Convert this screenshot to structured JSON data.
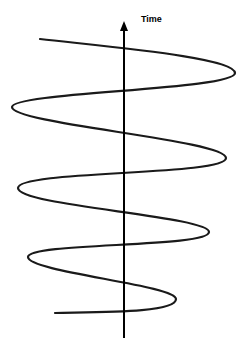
{
  "diagram": {
    "axis_label": "Time",
    "axis": {
      "x": 124,
      "top": 22,
      "bottom": 338,
      "color": "#000000"
    },
    "curve": {
      "description": "sinusoidal helix-like wave oscillating across a vertical time axis",
      "color": "#1a1a1a",
      "start": [
        40,
        39
      ],
      "turns": [
        [
          235,
          73
        ],
        [
          12,
          107
        ],
        [
          226,
          158
        ],
        [
          18,
          188
        ],
        [
          209,
          232
        ],
        [
          28,
          257
        ],
        [
          176,
          299
        ]
      ],
      "end": [
        55,
        313
      ]
    }
  }
}
